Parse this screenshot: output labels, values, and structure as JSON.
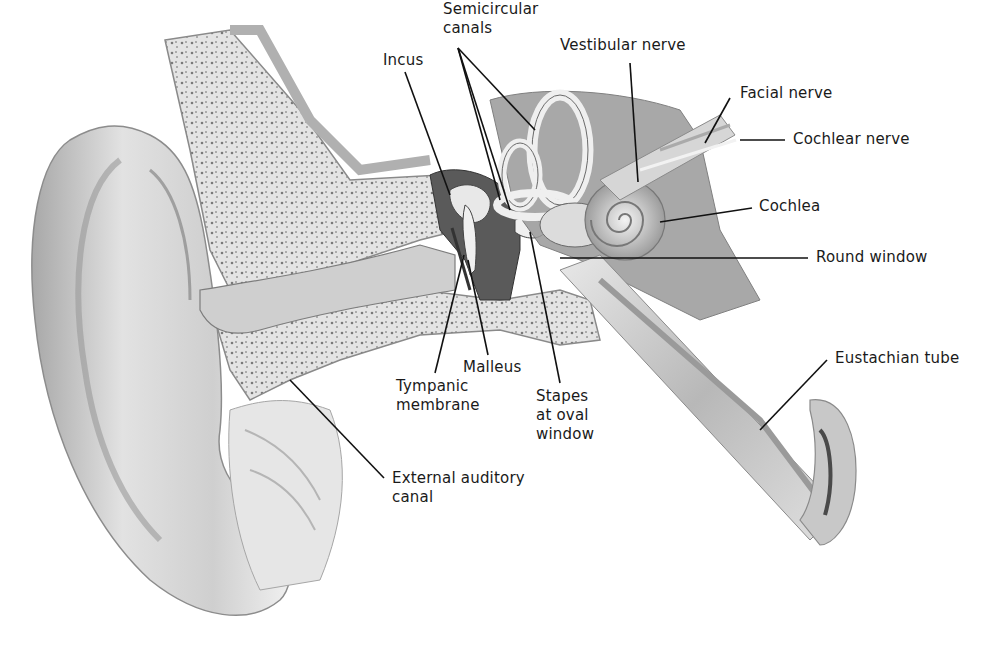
{
  "diagram": {
    "labels": [
      {
        "id": "semicircular-canals",
        "text": "Semicircular\ncanals",
        "x": 443,
        "y": 0
      },
      {
        "id": "incus",
        "text": "Incus",
        "x": 383,
        "y": 51
      },
      {
        "id": "vestibular-nerve",
        "text": "Vestibular nerve",
        "x": 560,
        "y": 36
      },
      {
        "id": "facial-nerve",
        "text": "Facial nerve",
        "x": 740,
        "y": 84
      },
      {
        "id": "cochlear-nerve",
        "text": "Cochlear nerve",
        "x": 793,
        "y": 130
      },
      {
        "id": "cochlea",
        "text": "Cochlea",
        "x": 759,
        "y": 197
      },
      {
        "id": "round-window",
        "text": "Round window",
        "x": 816,
        "y": 248
      },
      {
        "id": "eustachian-tube",
        "text": "Eustachian tube",
        "x": 835,
        "y": 349
      },
      {
        "id": "malleus",
        "text": "Malleus",
        "x": 463,
        "y": 358
      },
      {
        "id": "tympanic-membrane",
        "text": "Tympanic\nmembrane",
        "x": 396,
        "y": 377
      },
      {
        "id": "stapes-at-oval-window",
        "text": "Stapes\nat oval\nwindow",
        "x": 536,
        "y": 387
      },
      {
        "id": "external-auditory-canal",
        "text": "External auditory\ncanal",
        "x": 392,
        "y": 469
      }
    ],
    "colors": {
      "line": "#111111",
      "bone": "#d9d9d9",
      "shade": "#8a8a8a",
      "dark": "#4a4a4a",
      "skin": "#e6e6e6"
    }
  }
}
